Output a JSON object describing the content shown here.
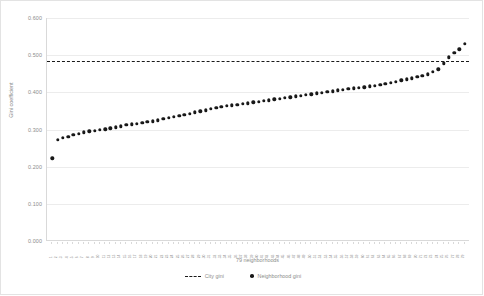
{
  "chart_data": {
    "type": "scatter",
    "title": "",
    "xlabel": "79 neighborhoods",
    "ylabel": "Gini coefficient",
    "ylim": [
      0.0,
      0.6
    ],
    "yticks": [
      "0.000",
      "0.100",
      "0.200",
      "0.300",
      "0.400",
      "0.500",
      "0.600"
    ],
    "ytick_values": [
      0.0,
      0.1,
      0.2,
      0.3,
      0.4,
      0.5,
      0.6
    ],
    "grid": true,
    "legend_position": "bottom",
    "series": [
      {
        "name": "Neighborhood gini",
        "marker": "circle",
        "color": "#181818",
        "values": [
          0.223,
          0.272,
          0.277,
          0.281,
          0.285,
          0.289,
          0.292,
          0.295,
          0.297,
          0.299,
          0.301,
          0.303,
          0.306,
          0.309,
          0.312,
          0.314,
          0.316,
          0.318,
          0.32,
          0.322,
          0.325,
          0.328,
          0.331,
          0.334,
          0.337,
          0.34,
          0.343,
          0.346,
          0.349,
          0.352,
          0.355,
          0.358,
          0.361,
          0.363,
          0.365,
          0.367,
          0.369,
          0.371,
          0.373,
          0.375,
          0.377,
          0.379,
          0.381,
          0.383,
          0.385,
          0.387,
          0.389,
          0.391,
          0.393,
          0.395,
          0.397,
          0.399,
          0.401,
          0.403,
          0.405,
          0.407,
          0.409,
          0.411,
          0.412,
          0.414,
          0.416,
          0.418,
          0.42,
          0.423,
          0.426,
          0.429,
          0.432,
          0.435,
          0.438,
          0.441,
          0.444,
          0.449,
          0.455,
          0.462,
          0.478,
          0.494,
          0.506,
          0.516,
          0.531
        ]
      },
      {
        "name": "City gini",
        "marker": "dashed-line",
        "color": "#1a1a1a",
        "value": 0.485
      }
    ],
    "xtick_labels": [
      "1",
      "2",
      "3",
      "4",
      "5",
      "6",
      "7",
      "8",
      "9",
      "10",
      "11",
      "12",
      "13",
      "14",
      "15",
      "16",
      "17",
      "18",
      "19",
      "20",
      "21",
      "22",
      "23",
      "24",
      "25",
      "26",
      "27",
      "28",
      "29",
      "30",
      "31",
      "32",
      "33",
      "34",
      "35",
      "36",
      "37",
      "38",
      "39",
      "40",
      "41",
      "42",
      "43",
      "44",
      "45",
      "46",
      "47",
      "48",
      "49",
      "50",
      "51",
      "52",
      "53",
      "54",
      "55",
      "56",
      "57",
      "58",
      "59",
      "60",
      "61",
      "62",
      "63",
      "64",
      "65",
      "66",
      "67",
      "68",
      "69",
      "70",
      "71",
      "72",
      "73",
      "74",
      "75",
      "76",
      "77",
      "78",
      "79"
    ]
  },
  "legend": {
    "city_label": "City gini",
    "neighborhood_label": "Neighborhood gini"
  },
  "axes": {
    "y_title": "Gini coefficient",
    "x_title": "79 neighborhoods"
  }
}
